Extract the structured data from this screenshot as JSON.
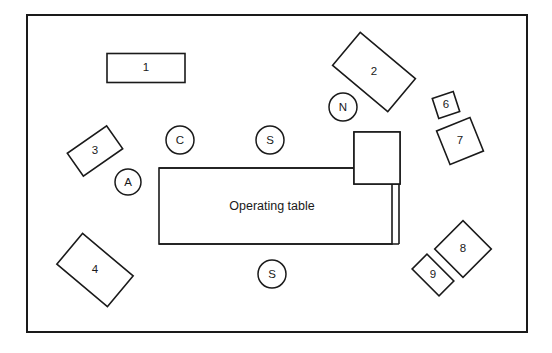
{
  "diagram": {
    "type": "floor-plan",
    "room": {
      "x": 27,
      "y": 15,
      "width": 500,
      "height": 317,
      "stroke": "#1a1a1a",
      "fill": "#ffffff"
    },
    "operating_table": {
      "label": "Operating table",
      "x": 159,
      "y": 168,
      "width": 233,
      "height": 76,
      "label_x": 272,
      "label_y": 207
    },
    "numbered_items": [
      {
        "id": "1",
        "label": "1",
        "shape": "rect",
        "cx": 146,
        "cy": 68,
        "w": 78,
        "h": 29,
        "rot": 0
      },
      {
        "id": "2",
        "label": "2",
        "shape": "rect",
        "cx": 374,
        "cy": 72,
        "w": 72,
        "h": 43,
        "rot": 40
      },
      {
        "id": "3",
        "label": "3",
        "shape": "rect",
        "cx": 95,
        "cy": 151,
        "w": 48,
        "h": 28,
        "rot": -35
      },
      {
        "id": "4",
        "label": "4",
        "shape": "rect",
        "cx": 95,
        "cy": 270,
        "w": 66,
        "h": 40,
        "rot": 40
      },
      {
        "id": "5",
        "label": "5",
        "shape": "rect",
        "cx": 377,
        "cy": 158,
        "w": 46,
        "h": 52,
        "rot": 0
      },
      {
        "id": "6",
        "label": "6",
        "shape": "rect",
        "cx": 446,
        "cy": 105,
        "w": 22,
        "h": 21,
        "rot": -18
      },
      {
        "id": "7",
        "label": "7",
        "shape": "rect",
        "cx": 460,
        "cy": 141,
        "w": 36,
        "h": 36,
        "rot": -22
      },
      {
        "id": "8",
        "label": "8",
        "shape": "rect",
        "cx": 463,
        "cy": 249,
        "w": 40,
        "h": 40,
        "rot": 45
      },
      {
        "id": "9",
        "label": "9",
        "shape": "rect",
        "cx": 433,
        "cy": 275,
        "w": 38,
        "h": 21,
        "rot": 45
      }
    ],
    "staff_circles": [
      {
        "id": "C",
        "label": "C",
        "cx": 180,
        "cy": 140,
        "r": 14
      },
      {
        "id": "S-upper",
        "label": "S",
        "cx": 270,
        "cy": 140,
        "r": 14
      },
      {
        "id": "N",
        "label": "N",
        "cx": 343,
        "cy": 107,
        "r": 14
      },
      {
        "id": "A",
        "label": "A",
        "cx": 128,
        "cy": 182,
        "r": 13
      },
      {
        "id": "S-lower",
        "label": "S",
        "cx": 272,
        "cy": 274,
        "r": 14
      }
    ],
    "dotted_marks": [
      {
        "name": "drape-horizontal",
        "x1": 358,
        "y1": 172,
        "x2": 396,
        "y2": 172
      },
      {
        "name": "drape-vertical",
        "x1": 394,
        "y1": 172,
        "x2": 394,
        "y2": 186
      }
    ]
  }
}
